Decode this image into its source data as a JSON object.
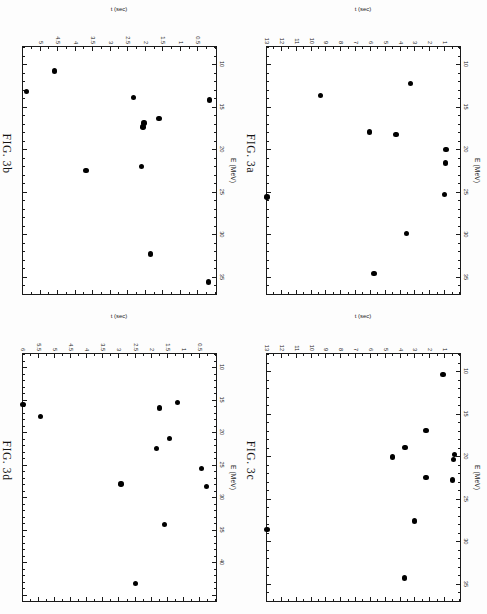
{
  "page": {
    "background": "#fdfdfd",
    "marker_color": "#000000",
    "axis_color": "#1a1a1a",
    "orientation": "rotated-90-cw"
  },
  "panels": [
    {
      "id": "fig3a",
      "caption": "FIG. 3a",
      "position": "top-right",
      "chart_data": {
        "type": "scatter",
        "title": "FIG. 3a",
        "xlabel": "E (MeV)",
        "ylabel": "t (sec)",
        "xlim": [
          8,
          37
        ],
        "ylim": [
          0,
          13
        ],
        "y_inverted": true,
        "grid": false,
        "legend": "none",
        "xticks": [
          10,
          15,
          20,
          25,
          30,
          35
        ],
        "yticks": [
          1,
          2,
          3,
          4,
          5,
          6,
          7,
          8,
          9,
          10,
          11,
          12,
          13
        ],
        "points": [
          {
            "x": 20.0,
            "y": 0.95
          },
          {
            "x": 21.6,
            "y": 0.98
          },
          {
            "x": 25.3,
            "y": 1.05
          },
          {
            "x": 12.3,
            "y": 3.35
          },
          {
            "x": 18.3,
            "y": 4.3
          },
          {
            "x": 29.9,
            "y": 3.6
          },
          {
            "x": 18.0,
            "y": 6.1
          },
          {
            "x": 34.6,
            "y": 5.8
          },
          {
            "x": 13.7,
            "y": 9.4
          },
          {
            "x": 25.6,
            "y": 13.0
          }
        ]
      }
    },
    {
      "id": "fig3b",
      "caption": "FIG. 3b",
      "position": "top-left",
      "chart_data": {
        "type": "scatter",
        "title": "FIG. 3b",
        "xlabel": "E (MeV)",
        "ylabel": "t (sec)",
        "xlim": [
          8,
          37
        ],
        "ylim": [
          0,
          5.5
        ],
        "y_inverted": true,
        "grid": false,
        "legend": "none",
        "xticks": [
          10,
          15,
          20,
          25,
          30,
          35
        ],
        "yticks": [
          0.5,
          1,
          1.5,
          2,
          2.5,
          3,
          3.5,
          4,
          4.5,
          5
        ],
        "points": [
          {
            "x": 14.2,
            "y": 0.18
          },
          {
            "x": 35.6,
            "y": 0.22
          },
          {
            "x": 16.4,
            "y": 1.62
          },
          {
            "x": 16.9,
            "y": 2.05
          },
          {
            "x": 17.4,
            "y": 2.08
          },
          {
            "x": 13.9,
            "y": 2.35
          },
          {
            "x": 22.0,
            "y": 2.12
          },
          {
            "x": 32.3,
            "y": 1.86
          },
          {
            "x": 22.5,
            "y": 3.7
          },
          {
            "x": 10.8,
            "y": 4.6
          },
          {
            "x": 13.2,
            "y": 5.4
          }
        ]
      }
    },
    {
      "id": "fig3c",
      "caption": "FIG. 3c",
      "position": "bottom-right",
      "chart_data": {
        "type": "scatter",
        "title": "FIG. 3c",
        "xlabel": "E (MeV)",
        "ylabel": "t (sec)",
        "xlim": [
          8,
          37
        ],
        "ylim": [
          0,
          13
        ],
        "y_inverted": true,
        "grid": false,
        "legend": "none",
        "xticks": [
          10,
          15,
          20,
          25,
          30,
          35
        ],
        "yticks": [
          1,
          2,
          3,
          4,
          5,
          6,
          7,
          8,
          9,
          10,
          11,
          12,
          13
        ],
        "points": [
          {
            "x": 19.8,
            "y": 0.35
          },
          {
            "x": 20.4,
            "y": 0.45
          },
          {
            "x": 22.8,
            "y": 0.5
          },
          {
            "x": 10.4,
            "y": 1.15
          },
          {
            "x": 17.0,
            "y": 2.3
          },
          {
            "x": 22.5,
            "y": 2.3
          },
          {
            "x": 27.6,
            "y": 3.05
          },
          {
            "x": 19.0,
            "y": 3.7
          },
          {
            "x": 34.3,
            "y": 3.75
          },
          {
            "x": 20.1,
            "y": 4.55
          },
          {
            "x": 28.6,
            "y": 13.0
          }
        ]
      }
    },
    {
      "id": "fig3d",
      "caption": "FIG. 3d",
      "position": "bottom-left",
      "chart_data": {
        "type": "scatter",
        "title": "FIG. 3d",
        "xlabel": "E (MeV)",
        "ylabel": "t (sec)",
        "xlim": [
          8,
          46
        ],
        "ylim": [
          0,
          6
        ],
        "y_inverted": true,
        "grid": false,
        "legend": "none",
        "xticks": [
          10,
          15,
          20,
          25,
          30,
          35,
          40
        ],
        "yticks": [
          0.5,
          1,
          1.5,
          2,
          2.5,
          3,
          3.5,
          4,
          4.5,
          5,
          5.5,
          6
        ],
        "points": [
          {
            "x": 25.6,
            "y": 0.45
          },
          {
            "x": 28.4,
            "y": 0.3
          },
          {
            "x": 15.5,
            "y": 1.2
          },
          {
            "x": 21.0,
            "y": 1.45
          },
          {
            "x": 16.3,
            "y": 1.75
          },
          {
            "x": 22.5,
            "y": 1.85
          },
          {
            "x": 34.2,
            "y": 1.6
          },
          {
            "x": 28.0,
            "y": 2.95
          },
          {
            "x": 43.3,
            "y": 2.5
          },
          {
            "x": 17.6,
            "y": 5.45
          },
          {
            "x": 15.8,
            "y": 6.0
          }
        ]
      }
    }
  ]
}
